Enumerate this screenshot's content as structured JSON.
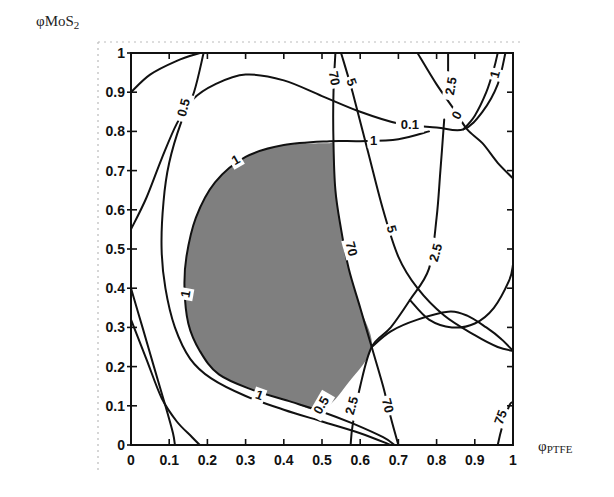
{
  "chart_data": {
    "type": "contour",
    "title": "",
    "xlabel": "φPTFE",
    "xlabel_main": "φ",
    "xlabel_sub": "PTFE",
    "ylabel": "φMoS2",
    "ylabel_main": "φMoS",
    "ylabel_sub": "2",
    "xlim": [
      0,
      1
    ],
    "ylim": [
      0,
      1
    ],
    "grid": false,
    "legend": "none",
    "xticks": [
      0,
      0.1,
      0.2,
      0.3,
      0.4,
      0.5,
      0.6,
      0.7,
      0.8,
      0.9,
      1
    ],
    "xtick_labels": [
      "0",
      "0.1",
      "0.2",
      "0.3",
      "0.4",
      "0.5",
      "0.6",
      "0.7",
      "0.8",
      "0.9",
      "1"
    ],
    "yticks": [
      0,
      0.1,
      0.2,
      0.3,
      0.4,
      0.5,
      0.6,
      0.7,
      0.8,
      0.9,
      1
    ],
    "ytick_labels": [
      "0",
      "0.1",
      "0.2",
      "0.3",
      "0.4",
      "0.5",
      "0.6",
      "0.7",
      "0.8",
      "0.9",
      "1"
    ],
    "shaded_region": {
      "description": "feasible region (grey)",
      "color": "#7f7f7f",
      "boundary": [
        [
          0.52,
          0.77
        ],
        [
          0.4,
          0.765
        ],
        [
          0.3,
          0.735
        ],
        [
          0.22,
          0.67
        ],
        [
          0.17,
          0.58
        ],
        [
          0.145,
          0.48
        ],
        [
          0.14,
          0.4
        ],
        [
          0.15,
          0.31
        ],
        [
          0.18,
          0.24
        ],
        [
          0.23,
          0.18
        ],
        [
          0.32,
          0.14
        ],
        [
          0.42,
          0.11
        ],
        [
          0.5,
          0.09
        ],
        [
          0.57,
          0.16
        ],
        [
          0.63,
          0.25
        ],
        [
          0.6,
          0.35
        ],
        [
          0.57,
          0.45
        ],
        [
          0.55,
          0.55
        ],
        [
          0.535,
          0.65
        ],
        [
          0.53,
          0.77
        ]
      ]
    },
    "contours": [
      {
        "level": "1",
        "name": "contour-1-left-corner",
        "points": [
          [
            0,
            0.9
          ],
          [
            0.05,
            0.945
          ],
          [
            0.12,
            0.98
          ],
          [
            0.18,
            1.0
          ]
        ]
      },
      {
        "level": "1",
        "name": "contour-1-main",
        "label_positions": [
          [
            0.27,
            0.725
          ],
          [
            0.145,
            0.39
          ],
          [
            0.32,
            0.125
          ],
          [
            0.67,
            0.78
          ]
        ],
        "points": [
          [
            0.78,
            0.8
          ],
          [
            0.7,
            0.78
          ],
          [
            0.6,
            0.775
          ],
          [
            0.52,
            0.775
          ],
          [
            0.4,
            0.765
          ],
          [
            0.3,
            0.735
          ],
          [
            0.22,
            0.67
          ],
          [
            0.17,
            0.58
          ],
          [
            0.145,
            0.48
          ],
          [
            0.14,
            0.4
          ],
          [
            0.15,
            0.31
          ],
          [
            0.18,
            0.24
          ],
          [
            0.23,
            0.18
          ],
          [
            0.32,
            0.14
          ],
          [
            0.42,
            0.11
          ],
          [
            0.5,
            0.085
          ],
          [
            0.58,
            0.055
          ],
          [
            0.66,
            0.02
          ],
          [
            0.69,
            0.0
          ]
        ]
      },
      {
        "level": "0.5",
        "name": "contour-0.5",
        "label_positions": [
          [
            0.14,
            0.85
          ],
          [
            0.5,
            0.1
          ]
        ],
        "points": [
          [
            0.19,
            1.0
          ],
          [
            0.165,
            0.9
          ],
          [
            0.13,
            0.82
          ],
          [
            0.1,
            0.72
          ],
          [
            0.085,
            0.62
          ],
          [
            0.08,
            0.5
          ],
          [
            0.09,
            0.4
          ],
          [
            0.115,
            0.3
          ],
          [
            0.155,
            0.22
          ],
          [
            0.21,
            0.17
          ],
          [
            0.3,
            0.125
          ],
          [
            0.4,
            0.09
          ],
          [
            0.5,
            0.06
          ],
          [
            0.6,
            0.03
          ],
          [
            0.68,
            0.0
          ]
        ]
      },
      {
        "level": "0.1",
        "name": "contour-0.1",
        "label_positions": [
          [
            0.73,
            0.815
          ]
        ],
        "points": [
          [
            0.0,
            0.55
          ],
          [
            0.04,
            0.63
          ],
          [
            0.08,
            0.73
          ],
          [
            0.12,
            0.82
          ],
          [
            0.16,
            0.88
          ],
          [
            0.22,
            0.92
          ],
          [
            0.3,
            0.945
          ],
          [
            0.4,
            0.93
          ],
          [
            0.5,
            0.89
          ],
          [
            0.6,
            0.85
          ],
          [
            0.7,
            0.82
          ],
          [
            0.8,
            0.81
          ],
          [
            0.87,
            0.805
          ],
          [
            0.92,
            0.85
          ],
          [
            0.96,
            0.92
          ],
          [
            0.98,
            1.0
          ]
        ]
      },
      {
        "level": "1",
        "name": "contour-1-top-right",
        "label_positions": [
          [
            0.96,
            0.94
          ]
        ],
        "points": [
          [
            0.87,
            0.805
          ],
          [
            0.9,
            0.84
          ],
          [
            0.93,
            0.9
          ],
          [
            0.95,
            0.96
          ],
          [
            0.96,
            1.0
          ]
        ]
      },
      {
        "level": "0",
        "name": "contour-0-top-right",
        "label_positions": [
          [
            0.85,
            0.84
          ]
        ],
        "points": [
          [
            0.75,
            1.0
          ],
          [
            0.8,
            0.92
          ],
          [
            0.85,
            0.85
          ],
          [
            0.88,
            0.805
          ],
          [
            0.92,
            0.77
          ],
          [
            0.96,
            0.72
          ],
          [
            1.0,
            0.68
          ]
        ]
      },
      {
        "level": "2.5",
        "name": "contour-2.5-top",
        "label_positions": [
          [
            0.84,
            0.9
          ]
        ],
        "points": [
          [
            0.83,
            1.0
          ],
          [
            0.83,
            0.95
          ]
        ]
      },
      {
        "level": "70",
        "name": "contour-70",
        "label_positions": [
          [
            0.54,
            0.93
          ],
          [
            0.57,
            0.5
          ],
          [
            0.7,
            0.02
          ]
        ],
        "points": [
          [
            0.535,
            1.0
          ],
          [
            0.53,
            0.9
          ],
          [
            0.53,
            0.77
          ],
          [
            0.535,
            0.65
          ],
          [
            0.55,
            0.55
          ],
          [
            0.57,
            0.45
          ],
          [
            0.6,
            0.35
          ],
          [
            0.63,
            0.25
          ],
          [
            0.66,
            0.15
          ],
          [
            0.68,
            0.07
          ],
          [
            0.7,
            0.0
          ]
        ]
      },
      {
        "level": "5",
        "name": "contour-5",
        "label_positions": [
          [
            0.58,
            0.93
          ],
          [
            0.68,
            0.55
          ]
        ],
        "points": [
          [
            0.55,
            1.0
          ],
          [
            0.58,
            0.9
          ],
          [
            0.62,
            0.75
          ],
          [
            0.66,
            0.6
          ],
          [
            0.7,
            0.48
          ],
          [
            0.75,
            0.4
          ],
          [
            0.82,
            0.33
          ],
          [
            0.9,
            0.28
          ],
          [
            0.96,
            0.25
          ],
          [
            1.0,
            0.24
          ]
        ]
      },
      {
        "level": "2.5",
        "name": "contour-2.5",
        "label_positions": [
          [
            0.8,
            0.49
          ],
          [
            0.56,
            0.08
          ]
        ],
        "points": [
          [
            0.82,
            0.83
          ],
          [
            0.81,
            0.7
          ],
          [
            0.8,
            0.58
          ],
          [
            0.78,
            0.45
          ],
          [
            0.73,
            0.37
          ],
          [
            0.68,
            0.3
          ],
          [
            0.63,
            0.25
          ],
          [
            0.6,
            0.15
          ],
          [
            0.58,
            0.05
          ],
          [
            0.575,
            0.0
          ]
        ]
      },
      {
        "level": "0.5",
        "name": "contour-0.5-lower-right",
        "points": [
          [
            0.63,
            0.25
          ],
          [
            0.68,
            0.29
          ],
          [
            0.75,
            0.32
          ],
          [
            0.83,
            0.34
          ],
          [
            0.88,
            0.33
          ],
          [
            0.93,
            0.3
          ],
          [
            0.97,
            0.27
          ],
          [
            1.0,
            0.24
          ]
        ]
      },
      {
        "level": "",
        "name": "contour-loop-right",
        "points": [
          [
            0.73,
            0.37
          ],
          [
            0.78,
            0.32
          ],
          [
            0.84,
            0.3
          ],
          [
            0.9,
            0.31
          ],
          [
            0.95,
            0.35
          ],
          [
            0.99,
            0.42
          ],
          [
            1.0,
            0.46
          ]
        ]
      },
      {
        "level": "",
        "name": "contour-left-lower-a",
        "points": [
          [
            0.0,
            0.4
          ],
          [
            0.03,
            0.3
          ],
          [
            0.06,
            0.2
          ],
          [
            0.09,
            0.1
          ],
          [
            0.11,
            0.03
          ],
          [
            0.115,
            0.0
          ]
        ]
      },
      {
        "level": "",
        "name": "contour-left-lower-b",
        "points": [
          [
            0.0,
            0.32
          ],
          [
            0.04,
            0.22
          ],
          [
            0.08,
            0.12
          ],
          [
            0.12,
            0.06
          ],
          [
            0.16,
            0.02
          ],
          [
            0.18,
            0.0
          ]
        ]
      },
      {
        "level": "75",
        "name": "contour-75",
        "label_positions": [
          [
            0.97,
            0.07
          ]
        ],
        "points": [
          [
            0.96,
            0.0
          ],
          [
            0.97,
            0.04
          ],
          [
            0.99,
            0.1
          ],
          [
            1.0,
            0.11
          ]
        ]
      }
    ],
    "contour_labels": [
      {
        "text": "0.5",
        "x": 0.14,
        "y": 0.86,
        "rotate": -75
      },
      {
        "text": "70",
        "x": 0.53,
        "y": 0.935,
        "rotate": 80
      },
      {
        "text": "5",
        "x": 0.575,
        "y": 0.925,
        "rotate": 70
      },
      {
        "text": "2.5",
        "x": 0.84,
        "y": 0.915,
        "rotate": -80
      },
      {
        "text": "1",
        "x": 0.955,
        "y": 0.945,
        "rotate": -75
      },
      {
        "text": "0.1",
        "x": 0.73,
        "y": 0.815,
        "rotate": 0
      },
      {
        "text": "0",
        "x": 0.855,
        "y": 0.84,
        "rotate": -60
      },
      {
        "text": "1",
        "x": 0.635,
        "y": 0.775,
        "rotate": 0
      },
      {
        "text": "1",
        "x": 0.275,
        "y": 0.725,
        "rotate": -30
      },
      {
        "text": "70",
        "x": 0.575,
        "y": 0.5,
        "rotate": 75
      },
      {
        "text": "5",
        "x": 0.68,
        "y": 0.55,
        "rotate": 75
      },
      {
        "text": "2.5",
        "x": 0.8,
        "y": 0.49,
        "rotate": -75
      },
      {
        "text": "1",
        "x": 0.145,
        "y": 0.385,
        "rotate": -80
      },
      {
        "text": "1",
        "x": 0.335,
        "y": 0.125,
        "rotate": 20
      },
      {
        "text": "0.5",
        "x": 0.5,
        "y": 0.1,
        "rotate": -60
      },
      {
        "text": "2.5",
        "x": 0.58,
        "y": 0.1,
        "rotate": -75
      },
      {
        "text": "70",
        "x": 0.67,
        "y": 0.1,
        "rotate": 75
      },
      {
        "text": "75",
        "x": 0.97,
        "y": 0.07,
        "rotate": -70
      }
    ],
    "colors": {
      "shaded": "#7f7f7f",
      "lines": "#111111",
      "background": "#ffffff"
    }
  }
}
